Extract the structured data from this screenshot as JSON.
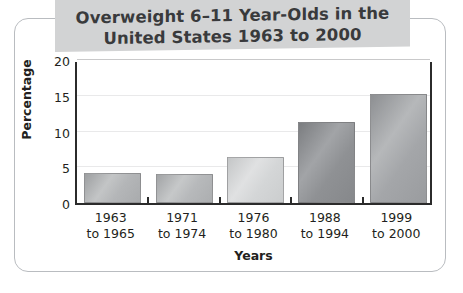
{
  "title": {
    "line1": "Overweight 6–11 Year-Olds in the",
    "line2": "United States 1963 to 2000"
  },
  "colors": {
    "banner": "#d2d3d4",
    "title_text": "#393a3c",
    "axis": "#2b2b2b",
    "gridline": "#e9e9ea",
    "card_border": "#b9bcc0",
    "text": "#231f20"
  },
  "chart_data": {
    "type": "bar",
    "title": "Overweight 6–11 Year-Olds in the United States 1963 to 2000",
    "xlabel": "Years",
    "ylabel": "Percentage",
    "categories": [
      "1963 to 1965",
      "1971 to 1974",
      "1976 to 1980",
      "1988 to 1994",
      "1999 to 2000"
    ],
    "category_lines": [
      [
        "1963",
        "to 1965"
      ],
      [
        "1971",
        "to 1974"
      ],
      [
        "1976",
        "to 1980"
      ],
      [
        "1988",
        "to 1994"
      ],
      [
        "1999",
        "to 2000"
      ]
    ],
    "values": [
      4.2,
      4.0,
      6.5,
      11.3,
      15.3
    ],
    "ylim": [
      0,
      20
    ],
    "yticks": [
      0,
      5,
      10,
      15,
      20
    ],
    "ytick_labels": [
      "0",
      "5",
      "10",
      "15",
      "20"
    ],
    "grid": true,
    "legend": "none",
    "bar_fills": [
      "linear-gradient(125deg, #9d9fa1 0%, #c3c5c6 38%, #b4b6b8 62%, #a9abad 100%)",
      "linear-gradient(125deg, #a2a4a6 0%, #c6c8c9 38%, #b7b9bb 62%, #acaeb0 100%)",
      "linear-gradient(125deg, #c4c6c7 0%, #e0e1e2 38%, #d4d6d7 62%, #cbcdce 100%)",
      "linear-gradient(125deg, #7b7d80 0%, #a2a4a7 38%, #8f9194 62%, #86888b 100%)",
      "linear-gradient(125deg, #8d8f92 0%, #b6b8ba 38%, #a4a6a9 62%, #9a9c9f 100%)"
    ]
  }
}
